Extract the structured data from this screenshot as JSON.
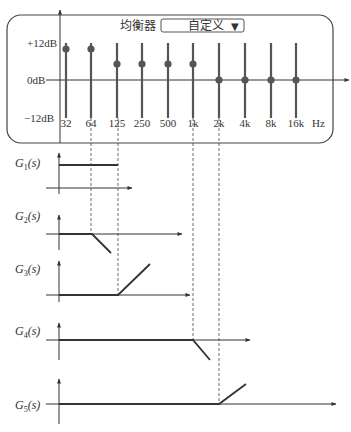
{
  "equalizer": {
    "title": "均衡器",
    "preset_value": "自定义",
    "dropdown_arrow": "▼",
    "y_labels": {
      "top": "+12dB",
      "mid": "0dB",
      "bottom": "−12dB"
    },
    "unit_label": "Hz",
    "bands": [
      {
        "label": "32",
        "x": 66,
        "knob_y": 49
      },
      {
        "label": "64",
        "x": 91,
        "knob_y": 49
      },
      {
        "label": "125",
        "x": 117,
        "knob_y": 64
      },
      {
        "label": "250",
        "x": 142,
        "knob_y": 64
      },
      {
        "label": "500",
        "x": 168,
        "knob_y": 64
      },
      {
        "label": "1k",
        "x": 193,
        "knob_y": 64
      },
      {
        "label": "2k",
        "x": 219,
        "knob_y": 80
      },
      {
        "label": "4k",
        "x": 245,
        "knob_y": 80
      },
      {
        "label": "8k",
        "x": 271,
        "knob_y": 80
      },
      {
        "label": "16k",
        "x": 296,
        "knob_y": 80
      }
    ]
  },
  "filters": [
    {
      "label_main": "G",
      "sub": "1",
      "label_tail": "(s)",
      "label_y": 167,
      "axis_top": 153,
      "axis_bottom": 194,
      "xaxis_y": 188,
      "xaxis_end": 132,
      "path": "M59,165 L118,165"
    },
    {
      "label_main": "G",
      "sub": "2",
      "label_tail": "(s)",
      "label_y": 220,
      "axis_top": 215,
      "axis_bottom": 250,
      "xaxis_y": 234,
      "xaxis_end": 182,
      "path": "M59,234 L92,234 L111,253"
    },
    {
      "label_main": "G",
      "sub": "3",
      "label_tail": "(s)",
      "label_y": 273,
      "axis_top": 261,
      "axis_bottom": 302,
      "xaxis_y": 295,
      "xaxis_end": 190,
      "path": "M59,295 L118,295 L150,264"
    },
    {
      "label_main": "G",
      "sub": "4",
      "label_tail": "(s)",
      "label_y": 335,
      "axis_top": 323,
      "axis_bottom": 360,
      "xaxis_y": 340,
      "xaxis_end": 250,
      "path": "M59,340 L193,340 L210,360"
    },
    {
      "label_main": "G",
      "sub": "5",
      "label_tail": "(s)",
      "label_y": 409,
      "axis_top": 379,
      "axis_bottom": 424,
      "xaxis_y": 404,
      "xaxis_end": 336,
      "path": "M59,404 L219,404 L246,384"
    }
  ],
  "dashed_guides": [
    {
      "x": 91,
      "y1": 118,
      "y2": 234
    },
    {
      "x": 118,
      "y1": 118,
      "y2": 295
    },
    {
      "x": 193,
      "y1": 118,
      "y2": 340
    },
    {
      "x": 219,
      "y1": 118,
      "y2": 404
    }
  ]
}
